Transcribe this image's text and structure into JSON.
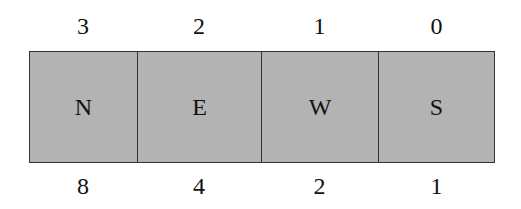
{
  "diagram": {
    "cells": [
      {
        "label": "N",
        "top": "3",
        "bottom": "8"
      },
      {
        "label": "E",
        "top": "2",
        "bottom": "4"
      },
      {
        "label": "W",
        "top": "1",
        "bottom": "2"
      },
      {
        "label": "S",
        "top": "0",
        "bottom": "1"
      }
    ],
    "fill_color": "#b3b3b3",
    "border_color": "#333333"
  }
}
